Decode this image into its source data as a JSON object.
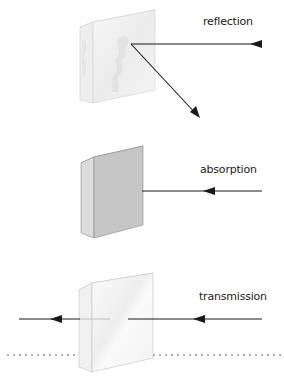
{
  "panels": [
    {
      "id": "reflection",
      "label": "reflection",
      "block_style": "frosted-white"
    },
    {
      "id": "absorption",
      "label": "absorption",
      "block_style": "solid-grey"
    },
    {
      "id": "transmission",
      "label": "transmission",
      "block_style": "clear-glass"
    }
  ],
  "colors": {
    "arrow": "#1a1a1a",
    "absorb_face": "#c6c6c6",
    "absorb_side": "#dcdcdc",
    "glass_edge": "#bdbdbd",
    "dots": "#9a9a9a"
  }
}
